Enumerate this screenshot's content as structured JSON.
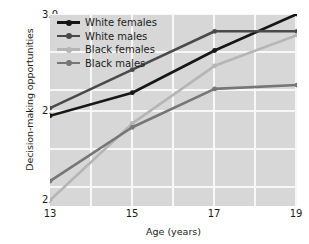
{
  "chart_data": {
    "type": "line",
    "title": "",
    "xlabel": "Age (years)",
    "ylabel": "Decision-making opportunities",
    "x": [
      13,
      15,
      17,
      19
    ],
    "xtick_labels": [
      "13",
      "15",
      "17",
      "19"
    ],
    "ytick_labels": [
      "3.0",
      "2.8",
      "2.5"
    ],
    "ytick_values": [
      3.0,
      2.8,
      2.5
    ],
    "xlim": [
      13,
      19
    ],
    "ylim": [
      2.5,
      3.0
    ],
    "grid": true,
    "legend_position": "top-left",
    "series": [
      {
        "name": "White females",
        "color": "#161616",
        "values": [
          2.735,
          2.795,
          2.905,
          3.0
        ]
      },
      {
        "name": "White males",
        "color": "#4a4a4a",
        "values": [
          2.755,
          2.855,
          2.955,
          2.955
        ]
      },
      {
        "name": "Black females",
        "color": "#b5b5b5",
        "values": [
          2.515,
          2.715,
          2.865,
          2.945
        ]
      },
      {
        "name": "Black males",
        "color": "#767676",
        "values": [
          2.565,
          2.705,
          2.805,
          2.815
        ]
      }
    ],
    "plot_background": "#d7d7d7",
    "gridline_color": "#f7f7f7",
    "page_background": "#ffffff"
  }
}
